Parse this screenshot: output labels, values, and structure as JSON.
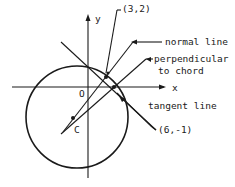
{
  "diagram": {
    "axes": {
      "x_label": "x",
      "y_label": "y",
      "origin_label": "O"
    },
    "circle": {
      "center_label": "C"
    },
    "points": {
      "p1": "(3,2)",
      "p2": "(6,-1)"
    },
    "labels": {
      "normal_line": "normal line",
      "perpendicular_line1": "perpendicular",
      "perpendicular_line2": "to chord",
      "tangent_line": "tangent line"
    },
    "colors": {
      "ink": "#1a1a1a",
      "background": "#ffffff"
    }
  }
}
